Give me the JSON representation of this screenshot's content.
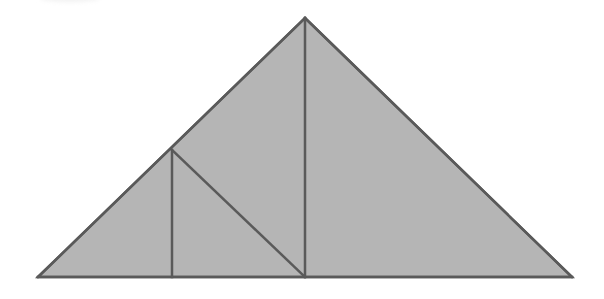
{
  "diagram": {
    "type": "geometric-figure",
    "colors": {
      "fill": "#b5b5b5",
      "stroke": "#5a5a5a",
      "background": "#ffffff"
    },
    "points": {
      "apex": [
        305,
        18
      ],
      "bottom_left": [
        38,
        277
      ],
      "bottom_right": [
        572,
        277
      ],
      "inner_vertex": [
        172,
        150
      ],
      "inner_base_left": [
        172,
        277
      ],
      "inner_base_right": [
        305,
        277
      ]
    },
    "segments": [
      {
        "name": "outer-left-edge",
        "from": "bottom_left",
        "to": "apex"
      },
      {
        "name": "outer-right-edge",
        "from": "apex",
        "to": "bottom_right"
      },
      {
        "name": "base",
        "from": "bottom_left",
        "to": "bottom_right"
      },
      {
        "name": "center-altitude",
        "from": "apex",
        "to": "inner_base_right"
      },
      {
        "name": "small-vertical",
        "from": "inner_vertex",
        "to": "inner_base_left"
      },
      {
        "name": "inner-diagonal",
        "from": "inner_vertex",
        "to": "inner_base_right"
      }
    ]
  }
}
